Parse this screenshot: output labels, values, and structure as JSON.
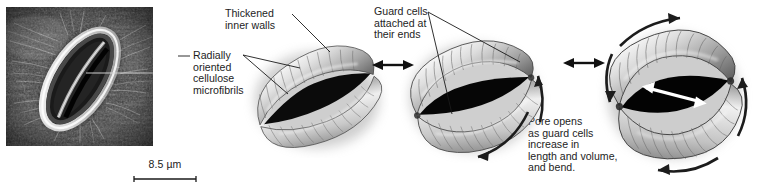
{
  "figure": {
    "background_color": "#ffffff",
    "text_color": "#1d1d1d"
  },
  "micrograph": {
    "name": "sem-micrograph-stoma",
    "description": "Scanning electron micrograph of a stoma",
    "scale_bar": {
      "label": "8.5 µm",
      "value": 8.5,
      "unit": "µm"
    }
  },
  "annotations": {
    "thickened_inner_walls": "Thickened\ninner walls",
    "radially_oriented": "Radially\noriented\ncellulose\nmicrofibrils",
    "guard_cells_attached": "Guard cells\nattached at\ntheir ends",
    "pore_opens": "Pore opens\nas guard cells\nincrease in\nlength and volume,\nand bend."
  },
  "panels": [
    {
      "name": "stoma-closed",
      "state": "closed",
      "pore_description": "narrow slit pore"
    },
    {
      "name": "stoma-partially-open",
      "state": "partially open",
      "pore_description": "lens-shaped pore opening"
    },
    {
      "name": "stoma-fully-open",
      "state": "fully open",
      "pore_description": "wide elliptical pore with expansion arrow"
    }
  ],
  "transition_arrows": [
    {
      "name": "transition-arrow-1",
      "type": "double-headed"
    },
    {
      "name": "transition-arrow-2",
      "type": "double-headed"
    }
  ]
}
